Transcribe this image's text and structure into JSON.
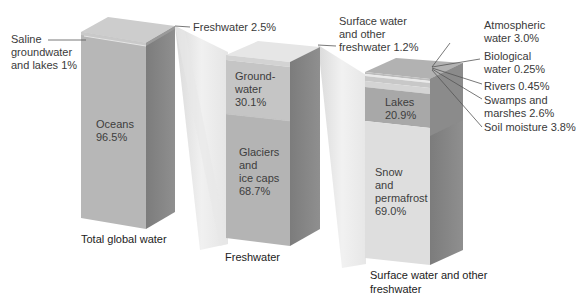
{
  "diagram": {
    "boxes": [
      {
        "id": "total",
        "caption": "Total global water",
        "segments": [
          {
            "name": "Oceans",
            "label": "Oceans\n96.5%",
            "value": 96.5,
            "color": "#b8b8b8"
          },
          {
            "name": "Saline groundwater and lakes",
            "value": 1.0,
            "color": "#c8c8c8"
          },
          {
            "name": "Freshwater",
            "value": 2.5,
            "color": "#cfcfcf"
          }
        ]
      },
      {
        "id": "freshwater",
        "caption": "Freshwater",
        "segments": [
          {
            "name": "Surface water and other freshwater",
            "value": 1.2,
            "color": "#d9d9d9"
          },
          {
            "name": "Groundwater",
            "label": "Ground-\nwater\n30.1%",
            "value": 30.1,
            "color": "#c6c6c6"
          },
          {
            "name": "Glaciers and ice caps",
            "label": "Glaciers\nand\nice caps\n68.7%",
            "value": 68.7,
            "color": "#b5b5b5"
          }
        ]
      },
      {
        "id": "surface",
        "caption": "Surface water and other\nfreshwater",
        "segments": [
          {
            "name": "Atmospheric water",
            "value": 3.0,
            "color": "#b0b0b0"
          },
          {
            "name": "Biological water",
            "value": 0.25,
            "color": "#bdbdbd"
          },
          {
            "name": "Rivers",
            "value": 0.45,
            "color": "#e4e4e4"
          },
          {
            "name": "Swamps and marshes",
            "value": 2.6,
            "color": "#c4c4c4"
          },
          {
            "name": "Soil moisture",
            "value": 3.8,
            "color": "#d0d0d0"
          },
          {
            "name": "Lakes",
            "label": "Lakes\n20.9%",
            "value": 20.9,
            "color": "#a9a9a9"
          },
          {
            "name": "Snow and permafrost",
            "label": "Snow\nand\npermafrost\n69.0%",
            "value": 69.0,
            "color": "#dddddd"
          }
        ]
      }
    ],
    "callouts": {
      "saline": "Saline\ngroundwater\nand lakes 1%",
      "freshwater": "Freshwater 2.5%",
      "surface": "Surface water\nand other\nfreshwater 1.2%",
      "atmospheric": "Atmospheric\nwater 3.0%",
      "biological": "Biological\nwater 0.25%",
      "rivers": "Rivers 0.45%",
      "swamps": "Swamps and\nmarshes 2.6%",
      "soil": "Soil moisture 3.8%"
    }
  }
}
